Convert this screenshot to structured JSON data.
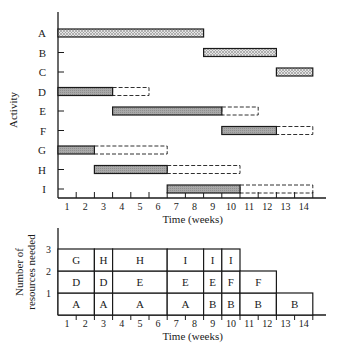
{
  "chart_data": [
    {
      "type": "gantt",
      "title": "",
      "xlabel": "Time (weeks)",
      "ylabel": "Activity",
      "xlim": [
        0,
        14
      ],
      "x_ticks": [
        "1",
        "2",
        "3",
        "4",
        "5",
        "6",
        "7",
        "8",
        "9",
        "10",
        "11",
        "12",
        "13",
        "14"
      ],
      "activities": [
        {
          "name": "A",
          "start": 0,
          "end": 8,
          "slack_end": null,
          "critical": true
        },
        {
          "name": "B",
          "start": 8,
          "end": 12,
          "slack_end": null,
          "critical": true
        },
        {
          "name": "C",
          "start": 12,
          "end": 14,
          "slack_end": null,
          "critical": true
        },
        {
          "name": "D",
          "start": 0,
          "end": 3,
          "slack_end": 5,
          "critical": false
        },
        {
          "name": "E",
          "start": 3,
          "end": 9,
          "slack_end": 11,
          "critical": false
        },
        {
          "name": "F",
          "start": 9,
          "end": 12,
          "slack_end": 14,
          "critical": false
        },
        {
          "name": "G",
          "start": 0,
          "end": 2,
          "slack_end": 6,
          "critical": false
        },
        {
          "name": "H",
          "start": 2,
          "end": 6,
          "slack_end": 10,
          "critical": false
        },
        {
          "name": "I",
          "start": 6,
          "end": 10,
          "slack_end": 14,
          "critical": false
        }
      ],
      "legend": {
        "critical": "dotted fill",
        "noncritical": "gray fill",
        "slack": "dashed outline"
      },
      "grid": false
    },
    {
      "type": "stacked-block",
      "xlabel": "Time (weeks)",
      "ylabel": "Number of resources needed",
      "xlim": [
        0,
        14
      ],
      "ylim": [
        0,
        3
      ],
      "y_ticks": [
        "1",
        "2",
        "3"
      ],
      "x_ticks": [
        "1",
        "2",
        "3",
        "4",
        "5",
        "6",
        "7",
        "8",
        "9",
        "10",
        "11",
        "12",
        "13",
        "14"
      ],
      "blocks": [
        {
          "start": 0,
          "end": 2,
          "level1": "A",
          "level2": "D",
          "level3": "G"
        },
        {
          "start": 2,
          "end": 3,
          "level1": "A",
          "level2": "D",
          "level3": "H"
        },
        {
          "start": 3,
          "end": 6,
          "level1": "A",
          "level2": "E",
          "level3": "H"
        },
        {
          "start": 6,
          "end": 8,
          "level1": "A",
          "level2": "E",
          "level3": "I"
        },
        {
          "start": 8,
          "end": 9,
          "level1": "B",
          "level2": "E",
          "level3": "I"
        },
        {
          "start": 9,
          "end": 10,
          "level1": "B",
          "level2": "F",
          "level3": "I"
        },
        {
          "start": 10,
          "end": 12,
          "level1": "B",
          "level2": "F",
          "level3": null
        },
        {
          "start": 12,
          "end": 14,
          "level1": "B",
          "level2": null,
          "level3": null
        }
      ]
    }
  ],
  "top": {
    "ylabel": "Activity",
    "xlabel": "Time (weeks)",
    "rows": [
      "A",
      "B",
      "C",
      "D",
      "E",
      "F",
      "G",
      "H",
      "I"
    ]
  },
  "bottom": {
    "ylabel_line1": "Number of",
    "ylabel_line2": "resources needed",
    "xlabel": "Time (weeks)"
  },
  "colors": {
    "ink": "#1a1a1a",
    "gray_fill": "#a8a8a8",
    "dot_fill": "#d6d6d6"
  }
}
